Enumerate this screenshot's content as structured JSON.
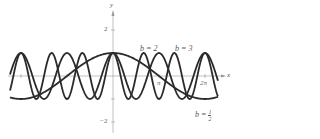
{
  "chart_data": {
    "type": "line",
    "title": "",
    "xlabel": "x",
    "ylabel": "y",
    "function": "y = cos(bx)",
    "xlim": [
      -7.1,
      7.1
    ],
    "ylim": [
      -2.3,
      2.3
    ],
    "xticks": [
      {
        "value": 3.14159,
        "label": "π"
      },
      {
        "value": 6.28318,
        "label": "2π"
      }
    ],
    "yticks": [
      {
        "value": 2,
        "label": "2"
      },
      {
        "value": 1,
        "label": ""
      },
      {
        "value": -1,
        "label": ""
      },
      {
        "value": -2,
        "label": "−2"
      }
    ],
    "grid": false,
    "series": [
      {
        "name": "b = 1/2",
        "b": 0.5
      },
      {
        "name": "b = 2",
        "b": 2
      },
      {
        "name": "b = 3",
        "b": 3
      }
    ],
    "annotations": [
      {
        "text": "b = 2",
        "x": 150,
        "y": 47
      },
      {
        "text": "b = 3",
        "x": 175,
        "y": 47
      },
      {
        "text": "b = 1/2",
        "x": 195,
        "y": 112
      }
    ]
  },
  "labels": {
    "x_axis": "x",
    "y_axis": "y",
    "pi": "π",
    "two_pi": "2π",
    "y2": "2",
    "yneg2": "−2",
    "b2": "b = 2",
    "b3": "b = 3",
    "bhalf_prefix": "b =",
    "bhalf_num": "1",
    "bhalf_den": "2"
  }
}
